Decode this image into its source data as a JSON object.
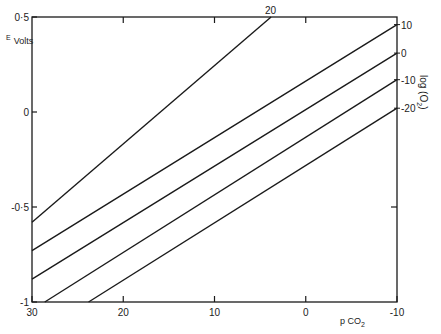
{
  "chart_data": {
    "type": "line",
    "title": "",
    "xlabel": "p CO2",
    "ylabel": "E Volts",
    "right_label": "log (O2)",
    "xlim": [
      30,
      -10
    ],
    "ylim": [
      -1,
      0.5
    ],
    "x_ticks": [
      30,
      20,
      10,
      0,
      -10
    ],
    "x_tick_labels": [
      "30",
      "20",
      "10",
      "0",
      "-10"
    ],
    "y_ticks": [
      0.5,
      0,
      -0.5,
      -1
    ],
    "y_tick_labels": [
      "0·5",
      "0",
      "-0·5",
      "-1"
    ],
    "grid": false,
    "series": [
      {
        "name": "20",
        "x": [
          30,
          3.8
        ],
        "y": [
          -0.58,
          0.5
        ]
      },
      {
        "name": "10",
        "x": [
          30,
          -10
        ],
        "y": [
          -0.73,
          0.46
        ]
      },
      {
        "name": "0",
        "x": [
          30,
          -10
        ],
        "y": [
          -0.88,
          0.31
        ]
      },
      {
        "name": "-10",
        "x": [
          28.6,
          -10
        ],
        "y": [
          -1.0,
          0.17
        ]
      },
      {
        "name": "-20",
        "x": [
          23.8,
          -10
        ],
        "y": [
          -1.0,
          0.02
        ]
      }
    ],
    "series_label_position": "right edge / top edge"
  },
  "labels": {
    "y_title_main": "E",
    "y_title_sub": "Volts",
    "x_title_main": "p CO",
    "x_title_sub": "2",
    "right_title_main": "log (O",
    "right_title_sub": "2",
    "right_title_close": ")"
  }
}
